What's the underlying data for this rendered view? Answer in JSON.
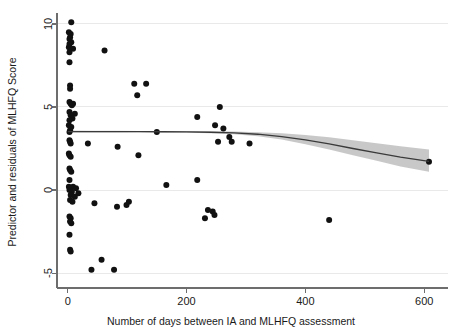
{
  "chart_data": {
    "type": "scatter",
    "title": "",
    "xlabel": "Number of days between IA and MLHFQ assessment",
    "ylabel": "Predictor and residuals of MLHFQ Score",
    "xlim": [
      -18,
      640
    ],
    "ylim": [
      -5.9,
      10.6
    ],
    "xticks": [
      0,
      200,
      400,
      600
    ],
    "xtick_labels": [
      "0",
      "200",
      "400",
      "600"
    ],
    "yticks": [
      -5,
      0,
      5,
      10
    ],
    "ytick_labels": [
      "-5",
      "0",
      "5",
      "10"
    ],
    "grid": "horizontal",
    "legend": "none",
    "point_color": "#111111",
    "line_color": "#3a3a3a",
    "band_color": "#9a9a9a",
    "axis_color": "#6d6d6d",
    "grid_color": "#e9e9e9",
    "points": [
      [
        6,
        10.1
      ],
      [
        2,
        9.5
      ],
      [
        5,
        9.4
      ],
      [
        4,
        9.2
      ],
      [
        3,
        9.1
      ],
      [
        6,
        8.9
      ],
      [
        3,
        8.8
      ],
      [
        2,
        8.6
      ],
      [
        9,
        8.5
      ],
      [
        3,
        8.3
      ],
      [
        62,
        8.4
      ],
      [
        3,
        7.7
      ],
      [
        4,
        6.3
      ],
      [
        4,
        6.1
      ],
      [
        112,
        6.4
      ],
      [
        132,
        6.4
      ],
      [
        3,
        5.3
      ],
      [
        5,
        5.2
      ],
      [
        9,
        5.2
      ],
      [
        7,
        5.1
      ],
      [
        117,
        5.7
      ],
      [
        3,
        4.7
      ],
      [
        12,
        4.6
      ],
      [
        5,
        4.5
      ],
      [
        8,
        4.3
      ],
      [
        3,
        4.2
      ],
      [
        256,
        5.0
      ],
      [
        218,
        4.4
      ],
      [
        2,
        3.9
      ],
      [
        6,
        3.8
      ],
      [
        4,
        3.6
      ],
      [
        3,
        3.5
      ],
      [
        248,
        3.9
      ],
      [
        262,
        3.7
      ],
      [
        272,
        3.2
      ],
      [
        150,
        3.5
      ],
      [
        3,
        3.0
      ],
      [
        4,
        2.9
      ],
      [
        5,
        2.8
      ],
      [
        34,
        2.8
      ],
      [
        84,
        2.6
      ],
      [
        253,
        2.9
      ],
      [
        276,
        2.9
      ],
      [
        306,
        2.8
      ],
      [
        2,
        2.2
      ],
      [
        3,
        2.1
      ],
      [
        5,
        2.0
      ],
      [
        119,
        2.1
      ],
      [
        608,
        1.7
      ],
      [
        3,
        1.3
      ],
      [
        4,
        1.2
      ],
      [
        6,
        1.1
      ],
      [
        3,
        0.6
      ],
      [
        218,
        0.6
      ],
      [
        2,
        0.2
      ],
      [
        9,
        0.2
      ],
      [
        14,
        0.1
      ],
      [
        3,
        0.0
      ],
      [
        7,
        -0.1
      ],
      [
        18,
        -0.2
      ],
      [
        5,
        -0.3
      ],
      [
        12,
        -0.4
      ],
      [
        166,
        0.3
      ],
      [
        4,
        -0.6
      ],
      [
        8,
        -0.7
      ],
      [
        45,
        -0.8
      ],
      [
        83,
        -1.0
      ],
      [
        99,
        -0.9
      ],
      [
        103,
        -0.7
      ],
      [
        236,
        -1.2
      ],
      [
        244,
        -1.3
      ],
      [
        247,
        -1.5
      ],
      [
        231,
        -1.7
      ],
      [
        440,
        -1.8
      ],
      [
        3,
        -1.6
      ],
      [
        5,
        -1.7
      ],
      [
        4,
        -1.9
      ],
      [
        6,
        -2.0
      ],
      [
        3,
        -2.7
      ],
      [
        4,
        -3.6
      ],
      [
        5,
        -3.7
      ],
      [
        57,
        -4.2
      ],
      [
        40,
        -4.8
      ],
      [
        78,
        -4.8
      ]
    ],
    "fit": {
      "label": "lowess fit",
      "x": [
        0,
        40,
        80,
        120,
        160,
        200,
        240,
        280,
        320,
        360,
        400,
        440,
        480,
        520,
        560,
        608
      ],
      "y": [
        3.52,
        3.52,
        3.52,
        3.52,
        3.51,
        3.5,
        3.48,
        3.44,
        3.36,
        3.22,
        3.02,
        2.78,
        2.5,
        2.24,
        1.98,
        1.72
      ],
      "ci_upper": [
        3.58,
        3.57,
        3.57,
        3.56,
        3.56,
        3.55,
        3.54,
        3.52,
        3.48,
        3.42,
        3.32,
        3.18,
        3.0,
        2.82,
        2.64,
        2.44
      ],
      "ci_lower": [
        3.46,
        3.47,
        3.47,
        3.48,
        3.46,
        3.45,
        3.42,
        3.36,
        3.24,
        3.04,
        2.76,
        2.44,
        2.1,
        1.76,
        1.42,
        1.1
      ]
    }
  }
}
